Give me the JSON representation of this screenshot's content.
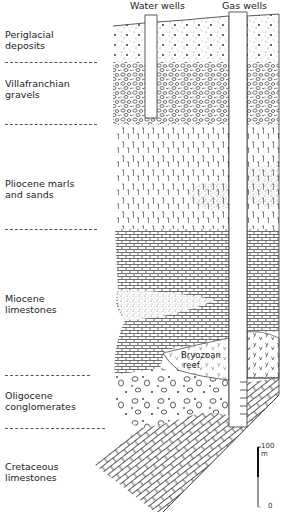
{
  "wells": {
    "water": "Water wells",
    "gas": "Gas wells"
  },
  "layers": [
    {
      "name": "Periglacial deposits",
      "line1": "Periglacial",
      "line2": "deposits",
      "pattern": "dotted"
    },
    {
      "name": "Villafranchian gravels",
      "line1": "Villafranchian",
      "line2": "gravels",
      "pattern": "gravel"
    },
    {
      "name": "Pliocene marls and sands",
      "line1": "Pliocene marls",
      "line2": "and sands",
      "pattern": "marl"
    },
    {
      "name": "Miocene limestones",
      "line1": "Miocene",
      "line2": "limestones",
      "pattern": "brick-fine"
    },
    {
      "name": "Oligocene conglomerates",
      "line1": "Oligocene",
      "line2": "conglomerates",
      "pattern": "pebbles"
    },
    {
      "name": "Cretaceous limestones",
      "line1": "Cretaceous",
      "line2": "limestones",
      "pattern": "brick-diagonal"
    }
  ],
  "annotations": {
    "reef_line1": "Bryozoan",
    "reef_line2": "reef"
  },
  "scale": {
    "top_label": "100 m",
    "bottom_label": "0",
    "upper_color": "#111111",
    "lower_color": "#999999"
  }
}
